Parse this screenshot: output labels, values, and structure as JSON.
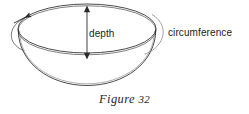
{
  "figure": {
    "caption_label": "Figure",
    "caption_number": "32",
    "background_color": "#ffffff",
    "stroke_color": "#2b2b2b"
  },
  "annotations": {
    "depth_label": "depth",
    "circumference_label": "circumference"
  },
  "icons": {
    "depth_arrow": "double-headed-vertical-arrow",
    "rotation_arrow": "curved-rotation-arrow"
  }
}
